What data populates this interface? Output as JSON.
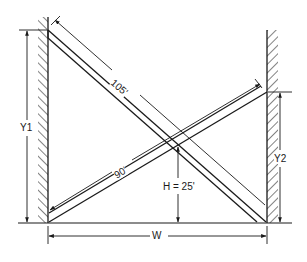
{
  "diagram": {
    "type": "crossed-ladders",
    "ink_color": "#1a1a1a",
    "background": "#ffffff",
    "labels": {
      "ladder_long": "105'",
      "ladder_short": "90'",
      "height": "H = 25'",
      "width": "W",
      "left_height": "Y1",
      "right_height": "Y2"
    },
    "elements": {
      "left_wall": "hatched wall (left)",
      "right_wall": "hatched wall (right)",
      "floor": "ground line",
      "ladder_105": "ladder from top of left wall to base of right wall",
      "ladder_90": "ladder from base of left wall to right wall at Y2",
      "crossing_point": "ladders intersect at height H"
    }
  }
}
